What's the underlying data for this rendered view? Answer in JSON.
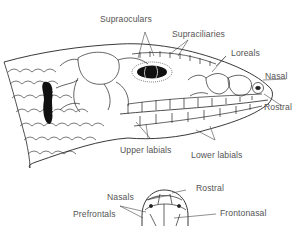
{
  "diagram": {
    "side_view_labels": {
      "supraoculars": "Supraoculars",
      "supraciliaries": "Supraciliaries",
      "loreals": "Loreals",
      "nasal": "Nasal",
      "rostral": "Rostral",
      "upper_labials": "Upper labials",
      "lower_labials": "Lower labials"
    },
    "top_view_labels": {
      "nasals": "Nasals",
      "rostral": "Rostral",
      "prefrontals": "Prefrontals",
      "frontonasal": "Frontonasal"
    },
    "colors": {
      "ink": "#1a1a1a",
      "label": "#555555",
      "leader": "#444444",
      "background": "#ffffff"
    }
  }
}
